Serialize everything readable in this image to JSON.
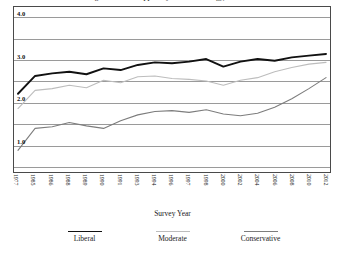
{
  "figure": {
    "title_clipped": "Figure 1. Mean Support by Political Ideology, 1977-2012"
  },
  "axes": {
    "xlabel": "Survey Year",
    "ylabel": "",
    "ytick_labels": [
      "4.0",
      "3.0",
      "2.0",
      "1.0"
    ],
    "ytick_values": [
      4.0,
      3.0,
      2.0,
      1.0
    ],
    "gridline_values": [
      4.0,
      3.5,
      3.0,
      2.5,
      2.0,
      1.5,
      1.0,
      0.5
    ],
    "ylim": [
      0.35,
      4.25
    ],
    "grid": "horizontal"
  },
  "legend": {
    "position": "bottom",
    "items": [
      {
        "label": "Liberal",
        "color": "#111111",
        "width": 1.9
      },
      {
        "label": "Moderate",
        "color": "#bdbdbd",
        "width": 1.3
      },
      {
        "label": "Conservative",
        "color": "#7d7d7d",
        "width": 1.3
      }
    ]
  },
  "chart_data": {
    "type": "line",
    "title": "Figure 1. Mean Support by Political Ideology, 1977-2012",
    "xlabel": "Survey Year",
    "ylabel": "",
    "ylim": [
      0.35,
      4.25
    ],
    "grid": true,
    "legend_position": "bottom",
    "categories": [
      "1977",
      "1985",
      "1986",
      "1988",
      "1989",
      "1990",
      "1991",
      "1993",
      "1994",
      "1996",
      "1997",
      "1998",
      "2000",
      "2002",
      "2004",
      "2006",
      "2008",
      "2010",
      "2012"
    ],
    "series": [
      {
        "name": "Liberal",
        "color": "#111111",
        "values": [
          2.2,
          2.62,
          2.68,
          2.72,
          2.66,
          2.8,
          2.76,
          2.88,
          2.94,
          2.92,
          2.96,
          3.02,
          2.84,
          2.96,
          3.02,
          2.98,
          3.06,
          3.1,
          3.14
        ]
      },
      {
        "name": "Moderate",
        "color": "#bdbdbd",
        "values": [
          1.85,
          2.28,
          2.32,
          2.4,
          2.34,
          2.52,
          2.46,
          2.6,
          2.62,
          2.56,
          2.54,
          2.5,
          2.4,
          2.52,
          2.58,
          2.72,
          2.82,
          2.9,
          2.94
        ]
      },
      {
        "name": "Conservative",
        "color": "#7d7d7d",
        "values": [
          0.86,
          1.38,
          1.42,
          1.52,
          1.44,
          1.38,
          1.56,
          1.7,
          1.78,
          1.8,
          1.76,
          1.82,
          1.72,
          1.68,
          1.74,
          1.88,
          2.08,
          2.32,
          2.58
        ]
      }
    ]
  }
}
